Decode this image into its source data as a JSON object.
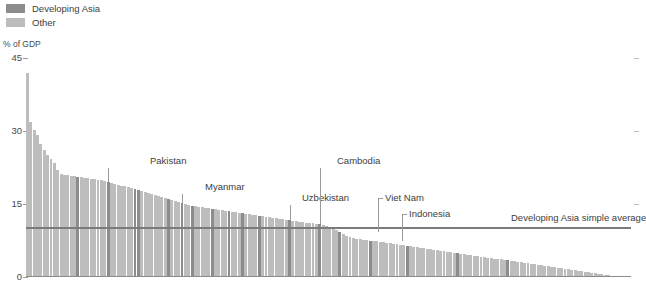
{
  "legend": {
    "items": [
      {
        "label": "Developing Asia",
        "color": "#8c8c8c"
      },
      {
        "label": "Other",
        "color": "#bdbdbd"
      }
    ]
  },
  "axis": {
    "y_title": "% of GDP",
    "y_ticks": [
      "45",
      "30",
      "15",
      "0"
    ],
    "y_tick_values": [
      45,
      30,
      15,
      0
    ]
  },
  "average_line": {
    "label": "Developing Asia simple average",
    "value": 10.2
  },
  "callouts": [
    {
      "label": "Pakistan",
      "index": 24
    },
    {
      "label": "Myanmar",
      "index": 46
    },
    {
      "label": "Uzbekistan",
      "index": 78
    },
    {
      "label": "Cambodia",
      "index": 87
    },
    {
      "label": "Viet Nam",
      "index": 93
    },
    {
      "label": "Indonesia",
      "index": 102
    }
  ],
  "chart_data": {
    "type": "bar",
    "title": "",
    "subtitle": "",
    "xlabel": "",
    "ylabel": "% of GDP",
    "ylim": [
      0,
      45
    ],
    "grid": false,
    "legend_position": "top-left",
    "series_colors": {
      "Developing Asia": "#8c8c8c",
      "Other": "#bdbdbd"
    },
    "categories_note": "Economies sorted descending by value; individual x tick labels not shown",
    "values": [
      42.0,
      31.9,
      30.3,
      29.2,
      27.4,
      26.1,
      25.0,
      24.2,
      23.4,
      22.0,
      21.2,
      21.0,
      20.9,
      20.8,
      20.7,
      20.6,
      20.5,
      20.4,
      20.3,
      20.2,
      20.1,
      20.0,
      19.9,
      19.8,
      19.6,
      19.4,
      19.2,
      19.0,
      18.8,
      18.6,
      18.4,
      18.2,
      18.0,
      17.8,
      17.6,
      17.4,
      17.2,
      17.0,
      16.8,
      16.6,
      16.4,
      16.2,
      16.0,
      15.8,
      15.6,
      15.4,
      15.2,
      15.0,
      14.8,
      14.6,
      14.5,
      14.4,
      14.3,
      14.2,
      14.1,
      14.0,
      13.9,
      13.8,
      13.7,
      13.6,
      13.5,
      13.4,
      13.3,
      13.2,
      13.1,
      13.0,
      12.9,
      12.8,
      12.7,
      12.6,
      12.5,
      12.4,
      12.3,
      12.2,
      12.1,
      12.0,
      11.9,
      11.8,
      11.7,
      11.6,
      11.5,
      11.4,
      11.3,
      11.2,
      11.1,
      11.0,
      10.9,
      10.8,
      10.6,
      10.4,
      10.2,
      10.0,
      9.6,
      9.2,
      8.8,
      8.5,
      8.2,
      8.0,
      7.9,
      7.8,
      7.7,
      7.6,
      7.5,
      7.4,
      7.3,
      7.2,
      7.1,
      7.0,
      6.9,
      6.8,
      6.7,
      6.6,
      6.5,
      6.4,
      6.3,
      6.2,
      6.1,
      6.0,
      5.9,
      5.8,
      5.7,
      5.6,
      5.5,
      5.4,
      5.3,
      5.2,
      5.1,
      5.0,
      4.9,
      4.8,
      4.7,
      4.6,
      4.5,
      4.4,
      4.3,
      4.2,
      4.1,
      4.0,
      3.9,
      3.8,
      3.7,
      3.6,
      3.5,
      3.4,
      3.3,
      3.2,
      3.1,
      3.0,
      2.9,
      2.8,
      2.7,
      2.6,
      2.5,
      2.4,
      2.3,
      2.2,
      2.1,
      2.0,
      1.9,
      1.8,
      1.7,
      1.6,
      1.5,
      1.4,
      1.3,
      1.2,
      1.1,
      1.0,
      0.9,
      0.8,
      0.7,
      0.6,
      0.5,
      0.4,
      0.3,
      0.25,
      0.2,
      0.15,
      0.1,
      0.05
    ],
    "groups": [
      "Other",
      "Other",
      "Other",
      "Other",
      "Other",
      "Other",
      "Other",
      "Other",
      "Other",
      "Other",
      "Other",
      "Other",
      "Other",
      "Other",
      "Other",
      "Developing Asia",
      "Other",
      "Other",
      "Other",
      "Other",
      "Other",
      "Other",
      "Other",
      "Other",
      "Developing Asia",
      "Other",
      "Other",
      "Other",
      "Other",
      "Other",
      "Other",
      "Other",
      "Developing Asia",
      "Developing Asia",
      "Other",
      "Other",
      "Other",
      "Other",
      "Other",
      "Other",
      "Other",
      "Other",
      "Developing Asia",
      "Other",
      "Other",
      "Other",
      "Developing Asia",
      "Other",
      "Other",
      "Developing Asia",
      "Other",
      "Other",
      "Other",
      "Other",
      "Other",
      "Developing Asia",
      "Other",
      "Other",
      "Other",
      "Other",
      "Developing Asia",
      "Other",
      "Other",
      "Other",
      "Developing Asia",
      "Other",
      "Other",
      "Other",
      "Other",
      "Developing Asia",
      "Other",
      "Other",
      "Other",
      "Other",
      "Other",
      "Other",
      "Other",
      "Other",
      "Developing Asia",
      "Other",
      "Other",
      "Other",
      "Other",
      "Other",
      "Other",
      "Other",
      "Other",
      "Developing Asia",
      "Other",
      "Other",
      "Other",
      "Other",
      "Other",
      "Developing Asia",
      "Other",
      "Other",
      "Other",
      "Other",
      "Other",
      "Other",
      "Other",
      "Other",
      "Developing Asia",
      "Other",
      "Other",
      "Other",
      "Other",
      "Other",
      "Other",
      "Other",
      "Other",
      "Other",
      "Other",
      "Developing Asia",
      "Other",
      "Other",
      "Other",
      "Other",
      "Other",
      "Other",
      "Other",
      "Other",
      "Other",
      "Other",
      "Other",
      "Other",
      "Other",
      "Other",
      "Developing Asia",
      "Other",
      "Other",
      "Other",
      "Other",
      "Other",
      "Other",
      "Other",
      "Other",
      "Other",
      "Other",
      "Other",
      "Other",
      "Other",
      "Other",
      "Developing Asia",
      "Other",
      "Other",
      "Other",
      "Other",
      "Other",
      "Other",
      "Other",
      "Other",
      "Other",
      "Other",
      "Other",
      "Other",
      "Other",
      "Other",
      "Other",
      "Other",
      "Other",
      "Other",
      "Other",
      "Other",
      "Other",
      "Other",
      "Other",
      "Other",
      "Other",
      "Other",
      "Other",
      "Other",
      "Other",
      "Other",
      "Other",
      "Other",
      "Other",
      "Other",
      "Other",
      "Other"
    ]
  }
}
